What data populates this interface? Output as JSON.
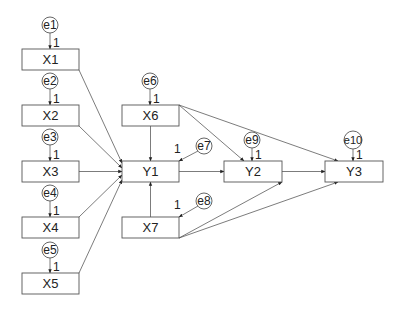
{
  "diagram": {
    "type": "path-diagram",
    "nodes": [
      {
        "id": "X1",
        "label": "X1",
        "kind": "observed",
        "x": 22,
        "y": 49,
        "w": 57,
        "h": 21
      },
      {
        "id": "X2",
        "label": "X2",
        "kind": "observed",
        "x": 22,
        "y": 105,
        "w": 57,
        "h": 21
      },
      {
        "id": "X3",
        "label": "X3",
        "kind": "observed",
        "x": 22,
        "y": 161,
        "w": 57,
        "h": 21
      },
      {
        "id": "X4",
        "label": "X4",
        "kind": "observed",
        "x": 22,
        "y": 217,
        "w": 57,
        "h": 21
      },
      {
        "id": "X5",
        "label": "X5",
        "kind": "observed",
        "x": 22,
        "y": 273,
        "w": 57,
        "h": 21
      },
      {
        "id": "X6",
        "label": "X6",
        "kind": "observed",
        "x": 122,
        "y": 105,
        "w": 57,
        "h": 21
      },
      {
        "id": "Y1",
        "label": "Y1",
        "kind": "observed",
        "x": 122,
        "y": 161,
        "w": 57,
        "h": 21
      },
      {
        "id": "X7",
        "label": "X7",
        "kind": "observed",
        "x": 122,
        "y": 217,
        "w": 57,
        "h": 21
      },
      {
        "id": "Y2",
        "label": "Y2",
        "kind": "observed",
        "x": 224,
        "y": 161,
        "w": 58,
        "h": 21
      },
      {
        "id": "Y3",
        "label": "Y3",
        "kind": "observed",
        "x": 325,
        "y": 161,
        "w": 58,
        "h": 21
      }
    ],
    "errors": [
      {
        "id": "e1",
        "label": "e1",
        "cx": 50,
        "cy": 25,
        "r": 8,
        "target": "X1",
        "weight": "1"
      },
      {
        "id": "e2",
        "label": "e2",
        "cx": 50,
        "cy": 81,
        "r": 8,
        "target": "X2",
        "weight": "1"
      },
      {
        "id": "e3",
        "label": "e3",
        "cx": 50,
        "cy": 137,
        "r": 8,
        "target": "X3",
        "weight": "1"
      },
      {
        "id": "e4",
        "label": "e4",
        "cx": 50,
        "cy": 193,
        "r": 8,
        "target": "X4",
        "weight": "1"
      },
      {
        "id": "e5",
        "label": "e5",
        "cx": 50,
        "cy": 250,
        "r": 8,
        "target": "X5",
        "weight": "1"
      },
      {
        "id": "e6",
        "label": "e6",
        "cx": 150,
        "cy": 81,
        "r": 8,
        "target": "X6",
        "weight": "1"
      },
      {
        "id": "e7",
        "label": "e7",
        "cx": 204,
        "cy": 146,
        "r": 8,
        "target": "Y1",
        "weight": "1"
      },
      {
        "id": "e8",
        "label": "e8",
        "cx": 204,
        "cy": 201,
        "r": 8,
        "target": "X7",
        "weight": "1"
      },
      {
        "id": "e9",
        "label": "e9",
        "cx": 252,
        "cy": 140,
        "r": 8,
        "target": "Y2",
        "weight": "1"
      },
      {
        "id": "e10",
        "label": "e10",
        "cx": 353,
        "cy": 140,
        "r": 9,
        "target": "Y3",
        "weight": "1"
      }
    ],
    "paths": [
      {
        "from": "X1",
        "to": "Y1"
      },
      {
        "from": "X2",
        "to": "Y1"
      },
      {
        "from": "X3",
        "to": "Y1"
      },
      {
        "from": "X4",
        "to": "Y1"
      },
      {
        "from": "X5",
        "to": "Y1"
      },
      {
        "from": "X6",
        "to": "Y1"
      },
      {
        "from": "X7",
        "to": "Y1"
      },
      {
        "from": "X6",
        "to": "Y2"
      },
      {
        "from": "X6",
        "to": "Y3"
      },
      {
        "from": "Y1",
        "to": "Y2"
      },
      {
        "from": "X7",
        "to": "Y2"
      },
      {
        "from": "X7",
        "to": "Y3"
      },
      {
        "from": "Y2",
        "to": "Y3"
      }
    ]
  }
}
